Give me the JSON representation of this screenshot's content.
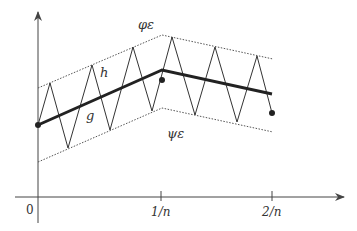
{
  "diagram": {
    "type": "function-approximation-sketch",
    "colors": {
      "axis": "#444444",
      "thin_line": "#333333",
      "thick_line": "#222222",
      "dotted_bound": "#555555",
      "background": "#ffffff"
    },
    "labels": {
      "upper_bound": "φε",
      "lower_bound": "ψε",
      "zigzag": "h",
      "piecewise": "g"
    },
    "x_axis": {
      "ticks": [
        {
          "label": "0"
        },
        {
          "label": "1/n"
        },
        {
          "label": "2/n"
        }
      ]
    },
    "curves": {
      "g_points": [
        [
          38,
          125
        ],
        [
          162,
          70
        ],
        [
          272,
          94
        ]
      ],
      "phi_points": [
        [
          38,
          88
        ],
        [
          162,
          35
        ],
        [
          273,
          59
        ]
      ],
      "psi_points": [
        [
          38,
          162
        ],
        [
          162,
          108
        ],
        [
          273,
          132
        ]
      ],
      "h_points": [
        [
          38,
          125
        ],
        [
          50,
          83
        ],
        [
          68,
          148
        ],
        [
          92,
          65
        ],
        [
          110,
          130
        ],
        [
          133,
          47
        ],
        [
          152,
          111
        ],
        [
          172,
          37
        ],
        [
          195,
          115
        ],
        [
          215,
          47
        ],
        [
          237,
          122
        ],
        [
          257,
          56
        ],
        [
          272,
          113
        ]
      ],
      "dots": [
        [
          38,
          125
        ],
        [
          162,
          80
        ],
        [
          272,
          113
        ]
      ]
    }
  }
}
